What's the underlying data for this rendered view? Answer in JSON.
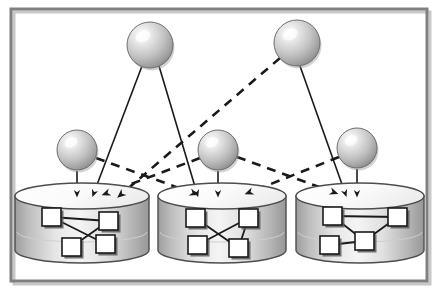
{
  "figure": {
    "width": 438,
    "height": 294,
    "background": "#ffffff"
  },
  "frame": {
    "name": "outer-border",
    "stroke": "#808080",
    "shadow": "#c8c8c8",
    "x": 11,
    "y": 9,
    "width": 416,
    "height": 272,
    "stroke_width": 3
  },
  "palette": {
    "sphere_light": "#ffffff",
    "sphere_mid": "#c9c9c9",
    "sphere_dark": "#8a8a8a",
    "sphere_stroke": "#6e6e6e",
    "cylinder_light": "#f2f2f2",
    "cylinder_mid": "#d9d9d9",
    "cylinder_dark": "#9a9a9a",
    "cylinder_stroke": "#4d4d4d",
    "node_fill": "#ffffff",
    "node_stroke": "#1a1a1a",
    "node_shadow": "#5a5a5a",
    "edge_solid": "#1a1a1a",
    "edge_dashed": "#1a1a1a"
  },
  "spheres": [
    {
      "id": "T1",
      "label": "top-left-sphere",
      "cx": 150,
      "cy": 45,
      "r": 23
    },
    {
      "id": "T2",
      "label": "top-right-sphere",
      "cx": 297,
      "cy": 43,
      "r": 23
    },
    {
      "id": "M1",
      "label": "mid-left-sphere",
      "cx": 77,
      "cy": 150,
      "r": 20
    },
    {
      "id": "M2",
      "label": "mid-center-sphere",
      "cx": 218,
      "cy": 150,
      "r": 20
    },
    {
      "id": "M3",
      "label": "mid-right-sphere",
      "cx": 357,
      "cy": 148,
      "r": 20
    }
  ],
  "cylinders": [
    {
      "id": "DB1",
      "label": "database-left",
      "cx": 82,
      "top_y": 196,
      "rx": 67,
      "ry": 13,
      "height": 54
    },
    {
      "id": "DB2",
      "label": "database-center",
      "cx": 222,
      "top_y": 196,
      "rx": 64,
      "ry": 13,
      "height": 54
    },
    {
      "id": "DB3",
      "label": "database-right",
      "cx": 360,
      "top_y": 196,
      "rx": 64,
      "ry": 13,
      "height": 54
    }
  ],
  "graph_nodes": [
    {
      "db": "DB1",
      "id": "n1",
      "x": 42,
      "y": 208,
      "w": 19,
      "h": 18
    },
    {
      "db": "DB1",
      "id": "n2",
      "x": 99,
      "y": 212,
      "w": 19,
      "h": 18
    },
    {
      "db": "DB1",
      "id": "n3",
      "x": 62,
      "y": 238,
      "w": 19,
      "h": 18
    },
    {
      "db": "DB1",
      "id": "n4",
      "x": 96,
      "y": 235,
      "w": 19,
      "h": 18
    },
    {
      "db": "DB2",
      "id": "n5",
      "x": 186,
      "y": 209,
      "w": 19,
      "h": 18
    },
    {
      "db": "DB2",
      "id": "n6",
      "x": 239,
      "y": 209,
      "w": 19,
      "h": 18
    },
    {
      "db": "DB2",
      "id": "n7",
      "x": 188,
      "y": 236,
      "w": 19,
      "h": 18
    },
    {
      "db": "DB2",
      "id": "n8",
      "x": 229,
      "y": 239,
      "w": 19,
      "h": 18
    },
    {
      "db": "DB3",
      "id": "n9",
      "x": 323,
      "y": 207,
      "w": 19,
      "h": 18
    },
    {
      "db": "DB3",
      "id": "n10",
      "x": 388,
      "y": 208,
      "w": 19,
      "h": 18
    },
    {
      "db": "DB3",
      "id": "n11",
      "x": 320,
      "y": 236,
      "w": 19,
      "h": 18
    },
    {
      "db": "DB3",
      "id": "n12",
      "x": 355,
      "y": 232,
      "w": 19,
      "h": 18
    }
  ],
  "graph_edges": [
    {
      "db": "DB1",
      "from": "n1",
      "to": "n2"
    },
    {
      "db": "DB1",
      "from": "n1",
      "to": "n4"
    },
    {
      "db": "DB1",
      "from": "n3",
      "to": "n2"
    },
    {
      "db": "DB2",
      "from": "n5",
      "to": "n8"
    },
    {
      "db": "DB2",
      "from": "n7",
      "to": "n6"
    },
    {
      "db": "DB2",
      "from": "n6",
      "to": "n8"
    },
    {
      "db": "DB3",
      "from": "n9",
      "to": "n10"
    },
    {
      "db": "DB3",
      "from": "n9",
      "to": "n12"
    },
    {
      "db": "DB3",
      "from": "n11",
      "to": "n12"
    },
    {
      "db": "DB3",
      "from": "n12",
      "to": "n10"
    }
  ],
  "connections": [
    {
      "id": "c1",
      "from": "T1",
      "to": "DB1",
      "style": "solid",
      "x1": 142,
      "y1": 66,
      "x2": 95,
      "y2": 190
    },
    {
      "id": "c2",
      "from": "T1",
      "to": "DB2",
      "style": "solid",
      "x1": 159,
      "y1": 66,
      "x2": 196,
      "y2": 190
    },
    {
      "id": "c3",
      "from": "T2",
      "to": "DB1",
      "style": "dashed",
      "x1": 280,
      "y1": 58,
      "x2": 124,
      "y2": 192
    },
    {
      "id": "c4",
      "from": "T2",
      "to": "DB3",
      "style": "solid",
      "x1": 300,
      "y1": 66,
      "x2": 344,
      "y2": 190
    },
    {
      "id": "c5",
      "from": "M1",
      "to": "DB1",
      "style": "solid",
      "x1": 77,
      "y1": 171,
      "x2": 77,
      "y2": 190
    },
    {
      "id": "c6",
      "from": "M1",
      "to": "DB2",
      "style": "dashed",
      "x1": 96,
      "y1": 158,
      "x2": 190,
      "y2": 192
    },
    {
      "id": "c7",
      "from": "M2",
      "to": "DB2",
      "style": "solid",
      "x1": 218,
      "y1": 171,
      "x2": 218,
      "y2": 190
    },
    {
      "id": "c8",
      "from": "M2",
      "to": "DB1",
      "style": "dashed",
      "x1": 200,
      "y1": 158,
      "x2": 110,
      "y2": 192
    },
    {
      "id": "c9",
      "from": "M2",
      "to": "DB3",
      "style": "dashed",
      "x1": 237,
      "y1": 157,
      "x2": 330,
      "y2": 191
    },
    {
      "id": "c10",
      "from": "M3",
      "to": "DB3",
      "style": "solid",
      "x1": 357,
      "y1": 169,
      "x2": 357,
      "y2": 190
    },
    {
      "id": "c11",
      "from": "M3",
      "to": "DB2",
      "style": "dashed",
      "x1": 339,
      "y1": 157,
      "x2": 253,
      "y2": 191
    }
  ]
}
